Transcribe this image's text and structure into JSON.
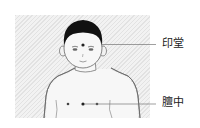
{
  "diagram": {
    "points": [
      {
        "id": "yintang",
        "label": "印堂",
        "location": "between the eyebrows"
      },
      {
        "id": "danzhong",
        "label": "膻中",
        "location": "center of chest between nipples"
      }
    ],
    "colors": {
      "background": "#ffffff",
      "panel": "#ececec",
      "outline": "#555555",
      "hair": "#111111",
      "leader_line": "#777777",
      "label_text": "#222222"
    }
  }
}
